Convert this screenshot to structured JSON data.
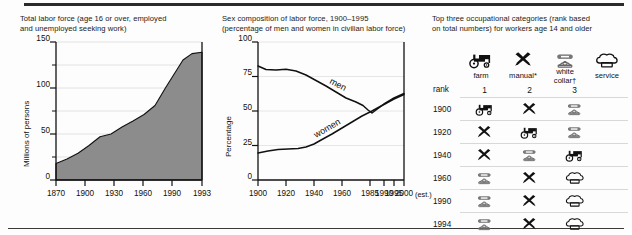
{
  "figure": {
    "background": "#fdfdfd",
    "rule_color": "#2b2b2b",
    "area_fill": "#8c8c8c"
  },
  "panels": {
    "total_labor": {
      "title": "Total labor force (age 16 or over, employed\nand unemployed seeking work)"
    },
    "sex_composition": {
      "title": "Sex composition of labor force, 1900–1995\n(percentage of men and women in civilian labor force)"
    },
    "occupations": {
      "title": "Top three occupational categories (rank based\non total numbers) for workers age 14 and older",
      "columns": [
        {
          "icon": "tractor-icon",
          "label": "farm",
          "rank": ""
        },
        {
          "icon": "crossed-tools-icon",
          "label": "manual*",
          "rank": "1"
        },
        {
          "icon": "telephone-icon",
          "label": "white collar†",
          "rank": "2"
        },
        {
          "icon": "chef-hat-icon",
          "label": "service",
          "rank": "3"
        }
      ],
      "rank_row_label": "rank",
      "rows": [
        {
          "year": "1900",
          "cells": [
            "tractor-icon",
            "crossed-tools-icon",
            "telephone-icon"
          ]
        },
        {
          "year": "1920",
          "cells": [
            "crossed-tools-icon",
            "tractor-icon",
            "telephone-icon"
          ]
        },
        {
          "year": "1940",
          "cells": [
            "crossed-tools-icon",
            "telephone-icon",
            "tractor-icon"
          ]
        },
        {
          "year": "1960",
          "cells": [
            "telephone-icon",
            "crossed-tools-icon",
            "chef-hat-icon"
          ]
        },
        {
          "year": "1990",
          "cells": [
            "telephone-icon",
            "crossed-tools-icon",
            "chef-hat-icon"
          ]
        },
        {
          "year": "1994",
          "cells": [
            "telephone-icon",
            "crossed-tools-icon",
            "chef-hat-icon"
          ]
        }
      ]
    }
  },
  "chart_data": [
    {
      "type": "area",
      "title": "Total labor force (age 16 or over, employed and unemployed seeking work)",
      "xlabel": "",
      "ylabel": "Millions of persons",
      "xlim": [
        1870,
        1993
      ],
      "ylim": [
        0,
        150
      ],
      "xticks": [
        "1870",
        "1900",
        "1930",
        "1960",
        "1990",
        "1993"
      ],
      "yticks": [
        "0",
        "50",
        "100",
        "150"
      ],
      "y_minor_ticks": [
        25,
        75,
        125
      ],
      "grid": true,
      "fill_color": "#8c8c8c",
      "x": [
        1870,
        1880,
        1890,
        1900,
        1910,
        1920,
        1930,
        1940,
        1950,
        1960,
        1970,
        1980,
        1990,
        1993
      ],
      "values": [
        18,
        22,
        27,
        33,
        40,
        43,
        49,
        55,
        62,
        71,
        86,
        108,
        126,
        133
      ]
    },
    {
      "type": "line",
      "title": "Sex composition of labor force, 1900–1995 (percentage of men and women in civilian labor force)",
      "xlabel": "",
      "ylabel": "Percentage",
      "xlim": [
        1900,
        2000
      ],
      "ylim": [
        0,
        100
      ],
      "xticks": [
        "1900",
        "1920",
        "1940",
        "1960",
        "1985",
        "1990",
        "1995",
        "2000"
      ],
      "x_note": "(est.)",
      "yticks": [
        "0",
        "25",
        "50",
        "75",
        "100"
      ],
      "grid": true,
      "legend": "inline-labels",
      "x": [
        1900,
        1910,
        1920,
        1930,
        1940,
        1950,
        1960,
        1970,
        1980,
        1985,
        1990,
        1995,
        2000
      ],
      "series": [
        {
          "name": "men",
          "label": "men",
          "values": [
            82,
            80,
            80,
            79,
            76,
            72,
            68,
            64,
            60,
            57,
            54,
            57,
            61
          ]
        },
        {
          "name": "women",
          "label": "women",
          "values": [
            19,
            21,
            22,
            23,
            24,
            28,
            33,
            38,
            43,
            46,
            48,
            52,
            55
          ]
        }
      ]
    },
    {
      "type": "table",
      "title": "Top three occupational categories (rank based on total numbers) for workers age 14 and older",
      "columns": [
        "",
        "1",
        "2",
        "3"
      ],
      "column_labels": [
        "farm",
        "manual*",
        "white collar†",
        "service"
      ],
      "rows": [
        [
          "1900",
          "farm",
          "manual",
          "white collar"
        ],
        [
          "1920",
          "manual",
          "farm",
          "white collar"
        ],
        [
          "1940",
          "manual",
          "white collar",
          "farm"
        ],
        [
          "1960",
          "white collar",
          "manual",
          "service"
        ],
        [
          "1990",
          "white collar",
          "manual",
          "service"
        ],
        [
          "1994",
          "white collar",
          "manual",
          "service"
        ]
      ]
    }
  ]
}
